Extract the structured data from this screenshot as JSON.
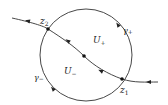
{
  "diagram": {
    "colors": {
      "stroke": "#333333",
      "text": "#222222",
      "background": "#ffffff"
    },
    "circle": {
      "cx": 86,
      "cy": 55,
      "r": 46
    },
    "curve": {
      "path": "M 12 18 C 30 22, 44 26, 48 29 C 62 38, 74 46, 84 56 C 94 66, 108 74, 122 79 C 134 83, 146 82, 158 82"
    },
    "points": [
      {
        "id": "z2",
        "x": 48,
        "y": 29
      },
      {
        "id": "center",
        "x": 84,
        "y": 56
      },
      {
        "id": "z1",
        "x": 122,
        "y": 79
      }
    ],
    "labels": {
      "z2": {
        "base": "z",
        "sub": "2"
      },
      "z1": {
        "base": "z",
        "sub": "1"
      },
      "u_plus": {
        "base": "U",
        "sub": "+"
      },
      "u_minus": {
        "base": "U",
        "sub": "−"
      },
      "gamma_plus": {
        "base": "γ",
        "sub": "+"
      },
      "gamma_minus": {
        "base": "γ",
        "sub": "−"
      }
    }
  }
}
